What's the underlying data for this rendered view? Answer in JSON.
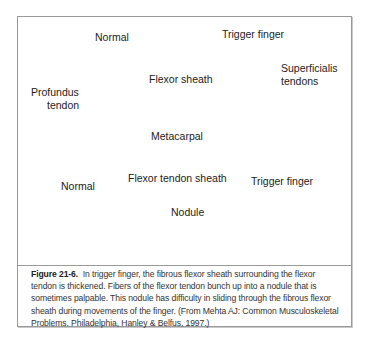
{
  "figure": {
    "top_panel": {
      "normal_title": "Normal",
      "trigger_title": "Trigger finger",
      "labels": {
        "flexor_sheath": "Flexor sheath",
        "superficialis_line1": "Superficialis",
        "superficialis_line2": "tendons",
        "profundus_line1": "Profundus",
        "profundus_line2": "tendon",
        "metacarpal": "Metacarpal"
      }
    },
    "bottom_panel": {
      "normal_title": "Normal",
      "trigger_title": "Trigger finger",
      "labels": {
        "flexor_tendon_sheath": "Flexor tendon sheath",
        "nodule": "Nodule"
      }
    },
    "caption": {
      "label": "Figure 21-6.",
      "text": "In trigger finger, the fibrous flexor sheath surrounding the flexor tendon is thickened. Fibers of the flexor tendon bunch up into a nodule that is sometimes palpable. This nodule has difficulty in sliding through the fibrous flexor sheath during movements of the finger. (From Mehta AJ: Common Musculoskeletal Problems. Philadelphia, Hanley & Belfus, 1997.)"
    }
  }
}
